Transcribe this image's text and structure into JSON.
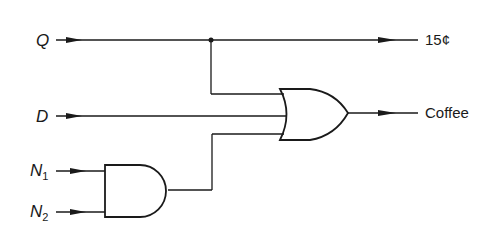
{
  "diagram": {
    "type": "logic-circuit",
    "inputs": [
      {
        "id": "Q",
        "label": "Q"
      },
      {
        "id": "D",
        "label": "D"
      },
      {
        "id": "N1",
        "label": "N",
        "subscript": "1"
      },
      {
        "id": "N2",
        "label": "N",
        "subscript": "2"
      }
    ],
    "outputs": [
      {
        "id": "15c",
        "label": "15¢"
      },
      {
        "id": "coffee",
        "label": "Coffee"
      }
    ],
    "gates": [
      {
        "type": "AND",
        "inputs": [
          "N1",
          "N2"
        ]
      },
      {
        "type": "OR",
        "inputs": [
          "Q",
          "D",
          "AND"
        ],
        "output": "Coffee"
      }
    ],
    "connections": [
      "Q -> 15¢",
      "Q -> OR",
      "D -> OR",
      "N1 -> AND",
      "N2 -> AND",
      "AND -> OR",
      "OR -> Coffee"
    ],
    "colors": {
      "line": "#1a1a1a",
      "background": "#ffffff"
    }
  }
}
